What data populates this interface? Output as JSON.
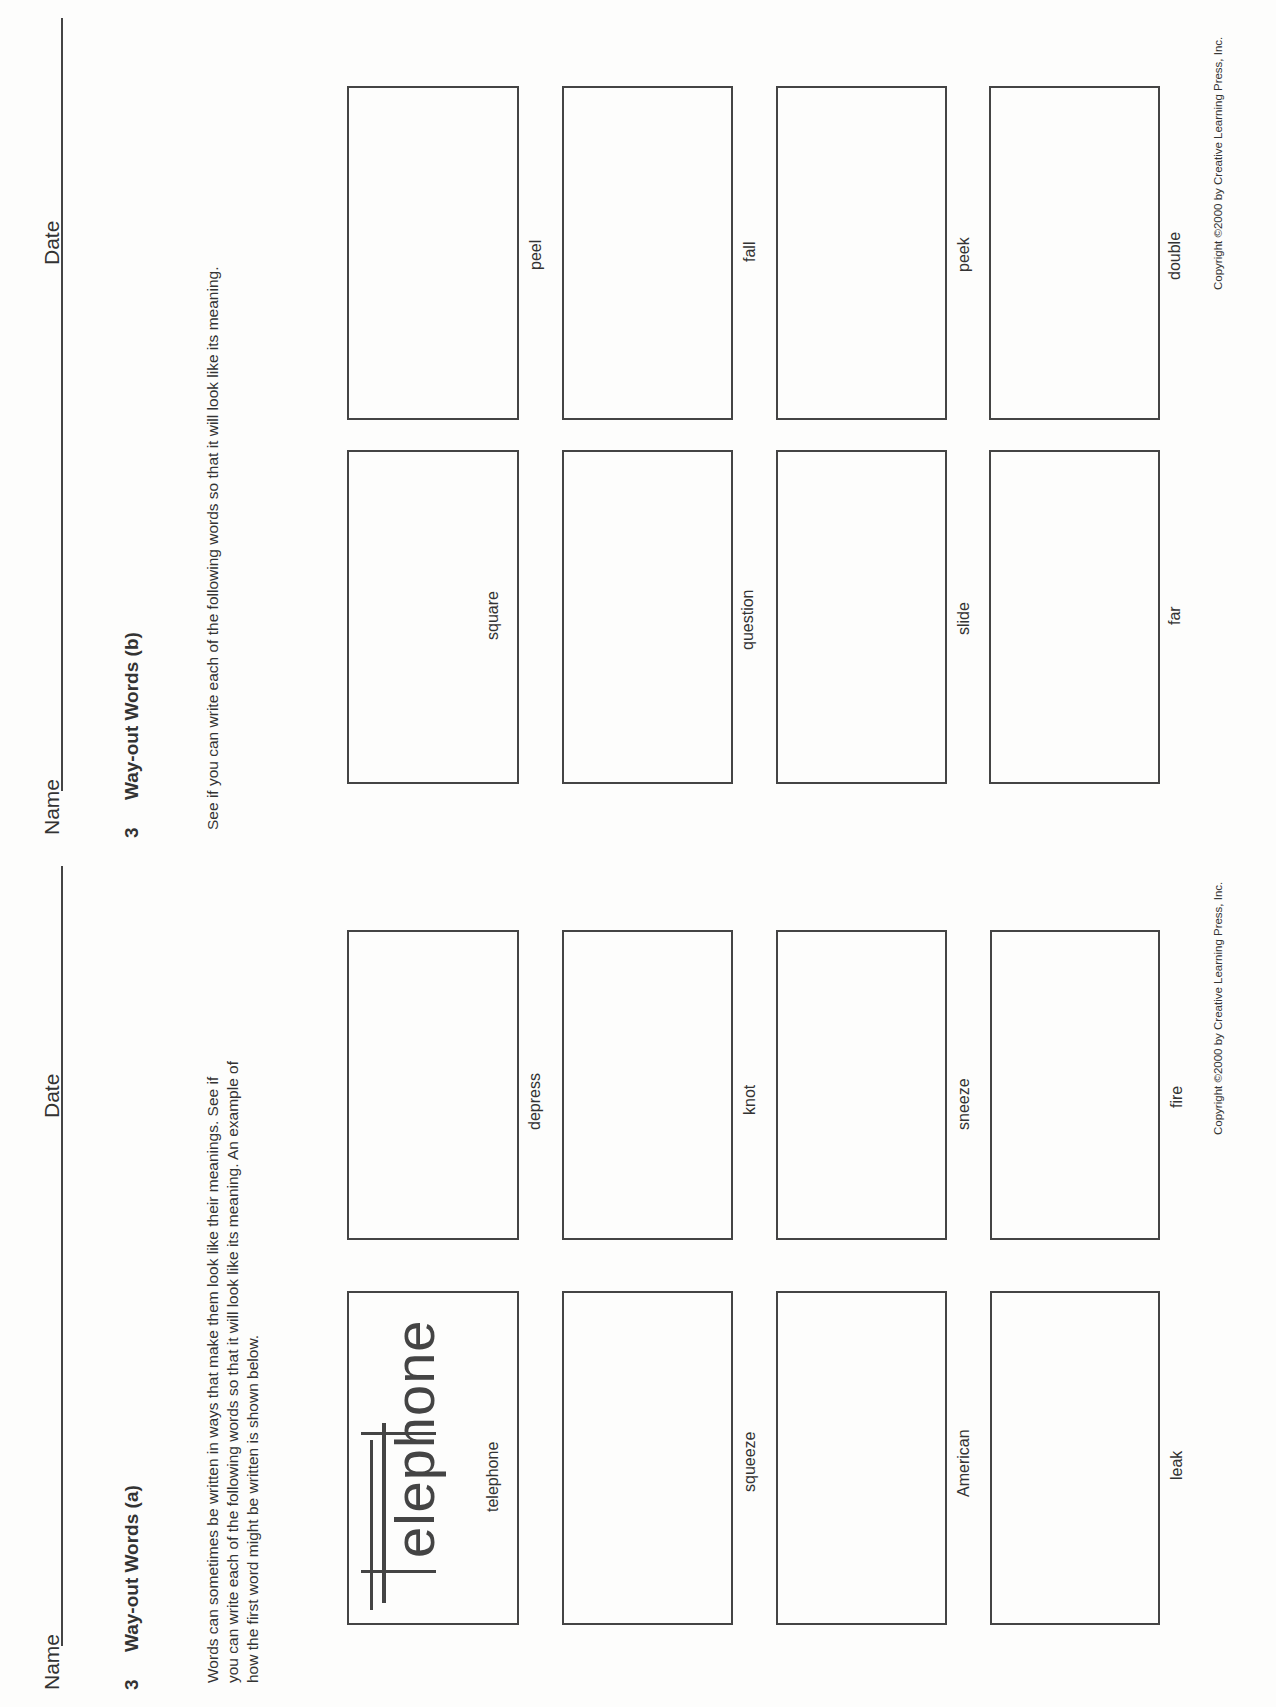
{
  "worksheet_b": {
    "name_label": "Name",
    "date_label": "Date",
    "number": "3",
    "title": "Way-out Words  (b)",
    "instructions": "See if you can write each of the following words so that it will look like its meaning.",
    "words": [
      "square",
      "peel",
      "question",
      "fall",
      "slide",
      "peek",
      "far",
      "double"
    ],
    "copyright": "Copyright ©2000 by Creative Learning Press, Inc."
  },
  "worksheet_a": {
    "name_label": "Name",
    "date_label": "Date",
    "number": "3",
    "title": "Way-out Words  (a)",
    "instructions": [
      "Words can sometimes be written in ways that make them look like their meanings. See if",
      "you can write each of the following words so that it will look like its meaning. An example of",
      "how the first word might be written is shown below."
    ],
    "words": [
      "telephone",
      "depress",
      "squeeze",
      "knot",
      "American",
      "sneeze",
      "leak",
      "fire"
    ],
    "example_word": "elephone",
    "copyright": "Copyright ©2000 by Creative Learning Press, Inc."
  }
}
